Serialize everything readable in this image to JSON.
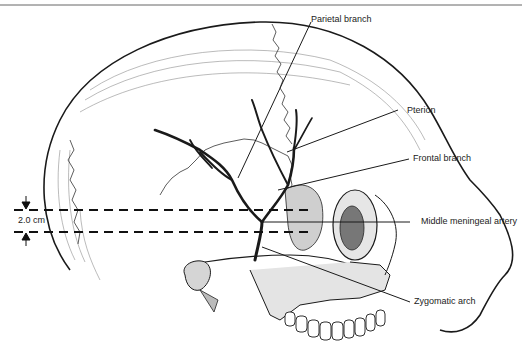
{
  "figure": {
    "type": "anatomical illustration",
    "labels": [
      {
        "id": "parietal",
        "text": "Parietal branch"
      },
      {
        "id": "pterion",
        "text": "Pterion"
      },
      {
        "id": "frontal",
        "text": "Frontal branch"
      },
      {
        "id": "mma",
        "text": "Middle meningeal artery"
      },
      {
        "id": "zygomatic",
        "text": "Zygomatic arch"
      }
    ],
    "measurement": {
      "text": "2.0 cm"
    }
  },
  "colors": {
    "ink": "#1a1a1a",
    "background": "#ffffff"
  }
}
